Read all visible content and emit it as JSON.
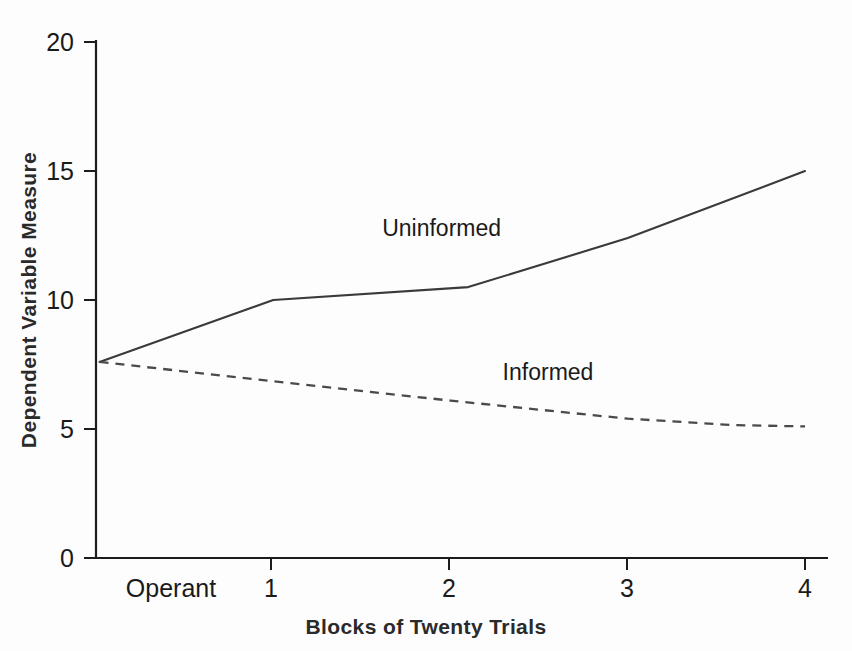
{
  "chart_data": {
    "type": "line",
    "title": "",
    "xlabel": "Blocks of Twenty Trials",
    "ylabel": "Dependent Variable Measure",
    "xlim": [
      0,
      4.6
    ],
    "ylim": [
      0,
      20
    ],
    "grid": false,
    "legend_position": "inline-annotation",
    "x_tick_labels": [
      "Operant",
      "1",
      "2",
      "3",
      "4"
    ],
    "x_tick_values": [
      0.42,
      1,
      2,
      3,
      4
    ],
    "y_tick_labels": [
      "0",
      "5",
      "10",
      "15",
      "20"
    ],
    "y_tick_values": [
      0,
      5,
      10,
      15,
      20
    ],
    "series": [
      {
        "name": "Uninformed",
        "style": "solid",
        "color": "#3a3a3a",
        "x": [
          0.02,
          1,
          2.1,
          3,
          4
        ],
        "values": [
          7.6,
          10.0,
          10.5,
          12.4,
          15.0
        ],
        "annotation": "Uninformed",
        "annotation_x": 1.95,
        "annotation_y": 12.5
      },
      {
        "name": "Informed",
        "style": "dashed",
        "color": "#4a4a4a",
        "x": [
          0.02,
          1,
          2,
          3,
          3.6,
          4
        ],
        "values": [
          7.6,
          6.85,
          6.1,
          5.4,
          5.15,
          5.1
        ],
        "annotation": "Informed",
        "annotation_x": 2.55,
        "annotation_y": 6.9
      }
    ]
  },
  "axes": {
    "x_axis_title": "Blocks of Twenty Trials",
    "y_axis_title": "Dependent Variable Measure"
  }
}
